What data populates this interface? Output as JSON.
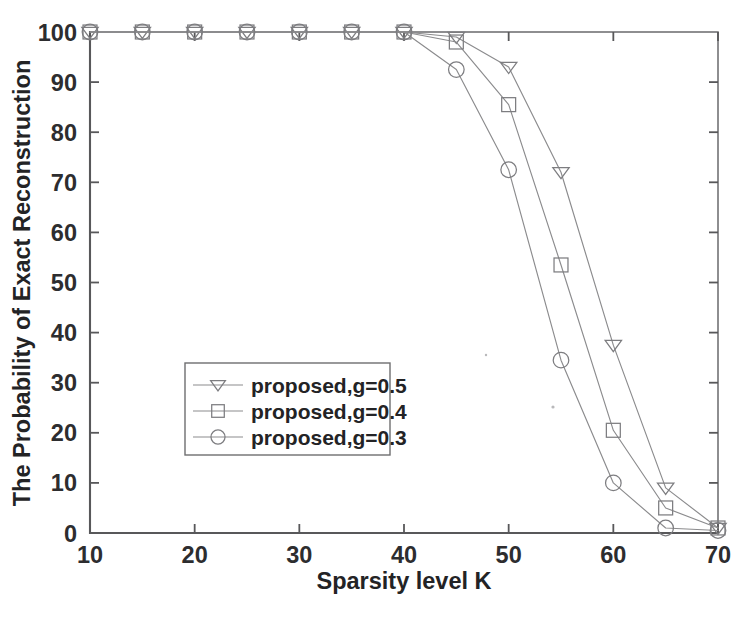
{
  "figure": {
    "width": 748,
    "height": 618,
    "background": "#ffffff",
    "line_color": "#8b8b8d",
    "axis_color": "#58585a",
    "text_color": "#232325"
  },
  "chart_data": {
    "type": "line",
    "title": "",
    "xlabel": "Sparsity level K",
    "ylabel": "The Probability of Exact Reconstruction",
    "xlim": [
      10,
      70
    ],
    "ylim": [
      0,
      100
    ],
    "xticks": [
      10,
      20,
      30,
      40,
      50,
      60,
      70
    ],
    "xtick_labels": [
      "10",
      "20",
      "30",
      "40",
      "50",
      "60",
      "70"
    ],
    "yticks": [
      0,
      10,
      20,
      30,
      40,
      50,
      60,
      70,
      80,
      90,
      100
    ],
    "ytick_labels": [
      "0",
      "10",
      "20",
      "30",
      "40",
      "50",
      "60",
      "70",
      "80",
      "90",
      "100"
    ],
    "grid": false,
    "legend_position": "center-left",
    "x": [
      10,
      15,
      20,
      25,
      30,
      35,
      40,
      45,
      50,
      55,
      60,
      65,
      70
    ],
    "series": [
      {
        "name": "proposed,g=0.5",
        "marker": "triangle-down",
        "values": [
          100,
          100,
          100,
          100,
          100,
          100,
          100,
          99.0,
          93.0,
          72.0,
          37.5,
          9.0,
          1.0
        ]
      },
      {
        "name": "proposed,g=0.4",
        "marker": "square",
        "values": [
          100,
          100,
          100,
          100,
          100,
          100,
          100,
          98.0,
          85.5,
          53.5,
          20.5,
          5.0,
          1.0
        ]
      },
      {
        "name": "proposed,g=0.3",
        "marker": "circle",
        "values": [
          100,
          100,
          100,
          100,
          100,
          100,
          100,
          92.5,
          72.5,
          34.5,
          10.0,
          1.0,
          0.5
        ]
      }
    ]
  },
  "legend": {
    "entries": [
      {
        "label": "proposed,g=0.5",
        "marker": "triangle-down-icon"
      },
      {
        "label": "proposed,g=0.4",
        "marker": "square-icon"
      },
      {
        "label": "proposed,g=0.3",
        "marker": "circle-icon"
      }
    ]
  }
}
